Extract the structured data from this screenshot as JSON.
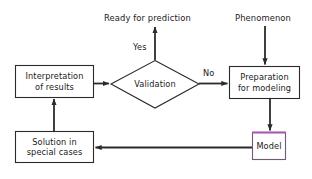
{
  "diagram": {
    "background_color": "#ffffff",
    "stroke_color": "#2b2b2b",
    "text_color": "#1a1a1a",
    "accent_color": "#a855b0",
    "nodes": {
      "interpretation": {
        "shape": "rectangle",
        "line1": "Interpretation",
        "line2": "of results"
      },
      "validation": {
        "shape": "diamond",
        "line1": "Validation"
      },
      "preparation": {
        "shape": "rectangle",
        "line1": "Preparation",
        "line2": "for modeling"
      },
      "model": {
        "shape": "rectangle",
        "line1": "Model",
        "top_border_color": "#a855b0"
      },
      "solution": {
        "shape": "rectangle",
        "line1": "Solution in",
        "line2": "special cases"
      }
    },
    "free_labels": {
      "ready_for_prediction": "Ready for prediction",
      "phenomenon": "Phenomenon"
    },
    "edge_labels": {
      "yes": "Yes",
      "no": "No"
    }
  }
}
